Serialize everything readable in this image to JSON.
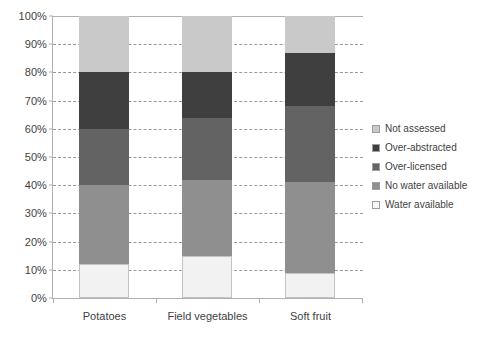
{
  "chart_data": {
    "type": "bar",
    "subtype": "stacked-percentage-column",
    "title": "",
    "subtitle": "",
    "xlabel": "",
    "ylabel": "",
    "categories": [
      "Potatoes",
      "Field vegetables",
      "Soft fruit"
    ],
    "ylim": [
      0,
      100
    ],
    "ytick_labels": [
      "0%",
      "10%",
      "20%",
      "30%",
      "40%",
      "50%",
      "60%",
      "70%",
      "80%",
      "90%",
      "100%"
    ],
    "ytick_values": [
      0,
      10,
      20,
      30,
      40,
      50,
      60,
      70,
      80,
      90,
      100
    ],
    "grid": true,
    "grid_style": "dashed-horizontal",
    "legend_position": "right",
    "stack_order_bottom_to_top": [
      "Water available",
      "No water available",
      "Over-licensed",
      "Over-abstracted",
      "Not assessed"
    ],
    "series": [
      {
        "name": "Not assessed",
        "color": "#c9c9c9",
        "values": [
          20,
          20,
          13
        ]
      },
      {
        "name": "Over-abstracted",
        "color": "#3f3f3f",
        "values": [
          20,
          16,
          19
        ]
      },
      {
        "name": "Over-licensed",
        "color": "#636363",
        "values": [
          20,
          22,
          27
        ]
      },
      {
        "name": "No water available",
        "color": "#8f8f8f",
        "values": [
          28,
          27,
          32
        ]
      },
      {
        "name": "Water available",
        "color": "#f2f2f2",
        "values": [
          12,
          15,
          9
        ]
      }
    ],
    "cumulative_tops": {
      "Potatoes": [
        12,
        40,
        60,
        80,
        100
      ],
      "Field vegetables": [
        15,
        42,
        64,
        80,
        100
      ],
      "Soft fruit": [
        9,
        41,
        68,
        87,
        100
      ]
    }
  },
  "legend": {
    "items": [
      {
        "label": "Not assessed",
        "color": "#c9c9c9"
      },
      {
        "label": "Over-abstracted",
        "color": "#3f3f3f"
      },
      {
        "label": "Over-licensed",
        "color": "#636363"
      },
      {
        "label": "No water available",
        "color": "#8f8f8f"
      },
      {
        "label": "Water available",
        "color": "#f7f7f7"
      }
    ]
  },
  "axes": {
    "y_ticks": [
      "100%",
      "90%",
      "80%",
      "70%",
      "60%",
      "50%",
      "40%",
      "30%",
      "20%",
      "10%",
      "0%"
    ],
    "x_labels": [
      "Potatoes",
      "Field vegetables",
      "Soft fruit"
    ]
  },
  "colors": {
    "plot_border": "#b0b0b0",
    "gridline": "#9a9a9a",
    "text": "#3f3f3f",
    "background": "#ffffff"
  }
}
